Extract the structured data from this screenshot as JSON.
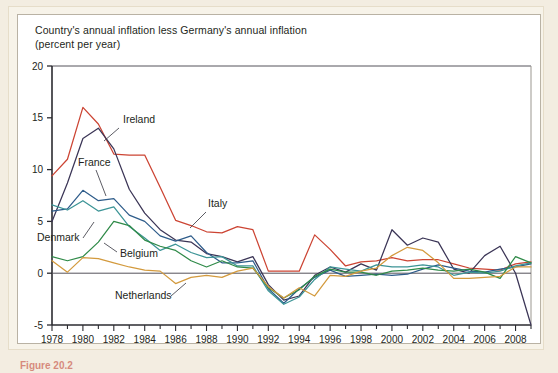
{
  "figure": {
    "caption": "Figure 20.2"
  },
  "chart_data": {
    "type": "line",
    "title": "Country's annual inflation less Germany's annual inflation",
    "subtitle": "(percent per year)",
    "xlabel": "",
    "ylabel": "",
    "grid": false,
    "legend_position": "inline-annotations",
    "xlim": [
      1978,
      2009
    ],
    "ylim": [
      -5,
      20
    ],
    "yticks": [
      -5,
      0,
      5,
      10,
      15,
      20
    ],
    "ytick_labels": [
      "-5",
      "0",
      "5",
      "10",
      "15",
      "20"
    ],
    "xticks": [
      1978,
      1980,
      1982,
      1984,
      1986,
      1988,
      1990,
      1992,
      1994,
      1996,
      1998,
      2000,
      2002,
      2004,
      2006,
      2008
    ],
    "xtick_labels": [
      "1978",
      "1980",
      "1982",
      "1984",
      "1986",
      "1988",
      "1990",
      "1992",
      "1994",
      "1996",
      "1998",
      "2000",
      "2002",
      "2004",
      "2006",
      "2008"
    ],
    "x": [
      1978,
      1979,
      1980,
      1981,
      1982,
      1983,
      1984,
      1985,
      1986,
      1987,
      1988,
      1989,
      1990,
      1991,
      1992,
      1993,
      1994,
      1995,
      1996,
      1997,
      1998,
      1999,
      2000,
      2001,
      2002,
      2003,
      2004,
      2005,
      2006,
      2007,
      2008,
      2009
    ],
    "series": [
      {
        "name": "Italy",
        "color": "#cc4433",
        "values": [
          9.4,
          11.0,
          16.0,
          14.4,
          11.5,
          11.4,
          11.4,
          8.3,
          5.1,
          4.6,
          4.0,
          3.9,
          4.5,
          4.2,
          0.2,
          0.2,
          0.2,
          3.7,
          2.3,
          0.7,
          1.1,
          1.2,
          1.5,
          1.2,
          1.3,
          1.3,
          0.9,
          0.5,
          0.4,
          0.3,
          0.9,
          1.1
        ]
      },
      {
        "name": "Ireland",
        "color": "#3b3556",
        "values": [
          5.0,
          8.7,
          13.0,
          14.0,
          12.0,
          8.1,
          5.8,
          4.2,
          3.2,
          3.0,
          1.9,
          1.6,
          1.1,
          1.6,
          -1.1,
          -2.6,
          -2.2,
          -0.2,
          0.6,
          0.1,
          0.9,
          0.3,
          4.2,
          2.7,
          3.4,
          3.0,
          0.4,
          0.0,
          1.7,
          2.6,
          0.0,
          -5.0
        ]
      },
      {
        "name": "France",
        "color": "#2e5c8a",
        "values": [
          6.0,
          6.2,
          8.0,
          7.0,
          7.2,
          5.6,
          5.0,
          3.6,
          3.1,
          3.6,
          2.0,
          1.0,
          1.0,
          1.2,
          -1.5,
          -2.9,
          -1.5,
          -0.4,
          0.3,
          -0.3,
          -0.2,
          -0.1,
          -0.2,
          -0.1,
          0.4,
          0.8,
          0.5,
          0.2,
          0.1,
          0.4,
          0.6,
          0.9
        ]
      },
      {
        "name": "Denmark",
        "color": "#3c9496",
        "values": [
          6.6,
          6.1,
          7.0,
          6.0,
          6.4,
          4.5,
          3.4,
          2.2,
          2.8,
          2.0,
          1.5,
          1.6,
          0.7,
          0.7,
          -1.7,
          -3.0,
          -2.3,
          -0.6,
          0.6,
          0.4,
          0.2,
          0.8,
          0.6,
          0.6,
          0.8,
          0.6,
          -0.2,
          0.1,
          0.0,
          0.2,
          0.7,
          1.0
        ]
      },
      {
        "name": "Belgium",
        "color": "#2f8a48",
        "values": [
          1.6,
          1.2,
          1.6,
          3.0,
          5.0,
          4.6,
          3.2,
          2.6,
          2.2,
          1.2,
          0.6,
          1.2,
          0.6,
          0.5,
          -1.4,
          -2.4,
          -1.6,
          -0.3,
          0.4,
          0.1,
          0.1,
          -0.2,
          0.2,
          0.3,
          0.5,
          0.3,
          0.2,
          0.4,
          0.1,
          -0.5,
          1.6,
          1.0
        ]
      },
      {
        "name": "Netherlands",
        "color": "#d39a3d",
        "values": [
          1.2,
          0.1,
          1.5,
          1.4,
          1.0,
          0.6,
          0.3,
          0.2,
          -1.0,
          -0.4,
          -0.2,
          -0.4,
          0.2,
          0.5,
          -1.3,
          -2.4,
          -1.4,
          -2.2,
          -0.2,
          -0.3,
          0.2,
          0.5,
          1.7,
          2.5,
          2.2,
          1.0,
          -0.5,
          -0.5,
          -0.4,
          -0.3,
          0.6,
          0.6
        ]
      }
    ],
    "annotations": [
      {
        "label": "Ireland",
        "x": 123,
        "y": 123,
        "lx1": 119,
        "ly1": 128,
        "lx2": 104,
        "ly2": 141
      },
      {
        "label": "France",
        "x": 78,
        "y": 166,
        "lx1": 96,
        "ly1": 170,
        "lx2": 106,
        "ly2": 196
      },
      {
        "label": "Italy",
        "x": 208,
        "y": 207,
        "lx1": 206,
        "ly1": 212,
        "lx2": 190,
        "ly2": 228
      },
      {
        "label": "Denmark",
        "x": 37,
        "y": 241,
        "lx1": 83,
        "ly1": 238,
        "lx2": 94,
        "ly2": 222
      },
      {
        "label": "Belgium",
        "x": 120,
        "y": 257,
        "lx1": 117,
        "ly1": 252,
        "lx2": 104,
        "ly2": 243
      },
      {
        "label": "Netherlands",
        "x": 115,
        "y": 299,
        "lx1": 171,
        "ly1": 296,
        "lx2": 186,
        "ly2": 283
      }
    ]
  }
}
